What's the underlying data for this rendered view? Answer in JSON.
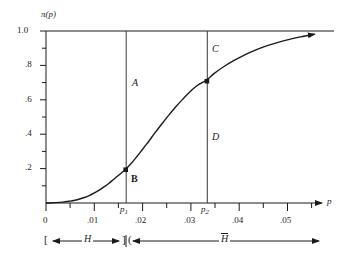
{
  "chart_data": {
    "type": "line",
    "title": "",
    "xlabel": "p",
    "ylabel": "π(p)",
    "xlim": [
      0,
      0.0575
    ],
    "ylim": [
      0,
      1.0
    ],
    "grid": false,
    "legend": "none",
    "x_ticks_major": [
      "0",
      ".01",
      ".02",
      ".03",
      ".04",
      ".05"
    ],
    "x_tick_values_major": [
      0,
      0.01,
      0.02,
      0.03,
      0.04,
      0.05
    ],
    "x_tick_values_minor": [
      0.005,
      0.015,
      0.025,
      0.035,
      0.045,
      0.055
    ],
    "y_ticks_major": [
      "1.0",
      ".8",
      ".6",
      ".4",
      ".2"
    ],
    "y_tick_values_major": [
      1.0,
      0.8,
      0.6,
      0.4,
      0.2
    ],
    "y_tick_values_minor": [
      0.9,
      0.7,
      0.5,
      0.3,
      0.1
    ],
    "series": [
      {
        "name": "pi(p)",
        "x": [
          0.0,
          0.002,
          0.0035,
          0.005,
          0.006,
          0.007,
          0.008,
          0.009,
          0.01,
          0.011,
          0.012,
          0.013,
          0.014,
          0.015,
          0.016,
          0.0166,
          0.0175,
          0.0185,
          0.0195,
          0.0205,
          0.0215,
          0.0225,
          0.024,
          0.0255,
          0.027,
          0.0285,
          0.03,
          0.0315,
          0.0334,
          0.035,
          0.037,
          0.039,
          0.041,
          0.043,
          0.0455,
          0.048,
          0.0505,
          0.053,
          0.056
        ],
        "y": [
          0.0,
          0.002,
          0.005,
          0.011,
          0.016,
          0.023,
          0.032,
          0.043,
          0.057,
          0.073,
          0.092,
          0.112,
          0.135,
          0.158,
          0.182,
          0.196,
          0.222,
          0.255,
          0.29,
          0.326,
          0.362,
          0.4,
          0.455,
          0.508,
          0.558,
          0.604,
          0.647,
          0.683,
          0.714,
          0.752,
          0.792,
          0.826,
          0.856,
          0.882,
          0.909,
          0.931,
          0.95,
          0.966,
          0.982
        ]
      }
    ],
    "vlines": [
      {
        "id": "p1",
        "label": "p₁",
        "x": 0.0166
      },
      {
        "id": "p2",
        "label": "p₂",
        "x": 0.0334
      }
    ],
    "markers": [
      {
        "id": "B",
        "x": 0.0166,
        "y": 0.196
      },
      {
        "id": "C",
        "x": 0.0334,
        "y": 0.714
      }
    ],
    "annotations": [
      {
        "id": "A",
        "text": "A",
        "style": "italic"
      },
      {
        "id": "B",
        "text": "B",
        "style": "bold"
      },
      {
        "id": "C",
        "text": "C",
        "style": "italic"
      },
      {
        "id": "D",
        "text": "D",
        "style": "italic"
      }
    ],
    "brackets": [
      {
        "id": "H",
        "label": "H",
        "overbar": false,
        "from": 0.0,
        "to": 0.0166
      },
      {
        "id": "Hbar",
        "label": "H",
        "overbar": true,
        "from": 0.0166,
        "to": 0.0575
      }
    ],
    "bracket_glyphs": {
      "left_open": "[",
      "mid_close": "]",
      "mid_open": "("
    },
    "colors": {
      "axis": "#1a1a1a",
      "curve": "#1a1a1a",
      "vline": "#3a3a3a",
      "background": "#ffffff"
    }
  },
  "axis_labels": {
    "y_axis_name": "π(p)",
    "x_axis_name": "p",
    "p1": "p",
    "p1_sub": "1",
    "p2": "p",
    "p2_sub": "2"
  }
}
